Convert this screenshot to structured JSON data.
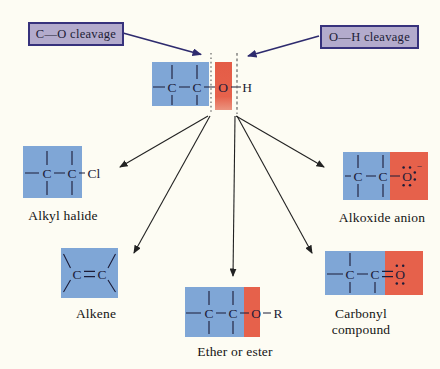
{
  "figure": {
    "topic": "Alcohol bond cleavage pathways",
    "callouts": {
      "left": "C—O cleavage",
      "right": "O—H cleavage"
    },
    "colors": {
      "carbon_region": "#7fa6d6",
      "oxygen_region": "#e6614b",
      "callout_fill": "#b3abcc",
      "callout_border": "#37327c",
      "cleavage_arrow": "#2e2b6e",
      "bond_and_text": "#1c1c38",
      "background": "#fdfcf3"
    },
    "molecules": {
      "central": {
        "atoms": {
          "c1": "C",
          "c2": "C",
          "o": "O",
          "h": "H"
        }
      },
      "alkyl_halide": {
        "caption": "Alkyl halide",
        "atoms": {
          "c1": "C",
          "c2": "C",
          "cl": "Cl"
        }
      },
      "alkene": {
        "caption": "Alkene",
        "atoms": {
          "c1": "C",
          "c2": "C"
        }
      },
      "ether_or_ester": {
        "caption": "Ether or ester",
        "atoms": {
          "c1": "C",
          "c2": "C",
          "o": "O",
          "r": "R"
        }
      },
      "alkoxide_anion": {
        "caption": "Alkoxide anion",
        "atoms": {
          "c1": "C",
          "c2": "C",
          "o": "O",
          "charge": "−"
        }
      },
      "carbonyl_compound": {
        "caption": "Carbonyl compound",
        "atoms": {
          "c1": "C",
          "c2": "C",
          "o": "O"
        }
      }
    }
  }
}
